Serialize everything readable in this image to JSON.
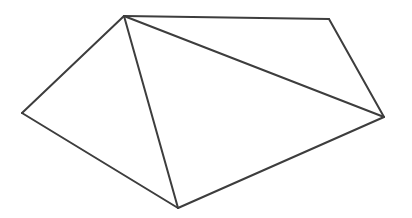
{
  "canvas": {
    "width": 412,
    "height": 218,
    "background_color": "#ffffff"
  },
  "figure": {
    "name": "pentagon-with-two-diagonals",
    "stroke_color": "#3d3d3d",
    "stroke_width": 2,
    "fill_color": "#ffffff",
    "vertices": [
      {
        "id": "apex",
        "label": "A",
        "x": 124,
        "y": 16
      },
      {
        "id": "top-right",
        "label": "B",
        "x": 329,
        "y": 19
      },
      {
        "id": "right",
        "label": "C",
        "x": 384,
        "y": 117
      },
      {
        "id": "bottom",
        "label": "D",
        "x": 178,
        "y": 208
      },
      {
        "id": "left",
        "label": "E",
        "x": 22,
        "y": 113
      }
    ],
    "outline_path": "M 124,16 L 329,19 L 384,117 L 178,208 L 22,113 Z",
    "edges": [
      {
        "id": "edge-top",
        "from": "apex",
        "to": "top-right",
        "kind": "outline",
        "path": "M 124,16 L 329,19"
      },
      {
        "id": "edge-upper-right",
        "from": "top-right",
        "to": "right",
        "kind": "outline",
        "path": "M 329,19 L 384,117"
      },
      {
        "id": "edge-lower-right",
        "from": "right",
        "to": "bottom",
        "kind": "outline",
        "path": "M 384,117 L 178,208"
      },
      {
        "id": "edge-lower-left",
        "from": "bottom",
        "to": "left",
        "kind": "outline",
        "path": "M 178,208 L 22,113"
      },
      {
        "id": "edge-upper-left",
        "from": "left",
        "to": "apex",
        "kind": "outline",
        "path": "M 22,113 L 124,16"
      },
      {
        "id": "diagonal-apex-bottom",
        "from": "apex",
        "to": "bottom",
        "kind": "diagonal",
        "path": "M 124,16 L 178,208"
      },
      {
        "id": "diagonal-apex-right",
        "from": "apex",
        "to": "right",
        "kind": "diagonal",
        "path": "M 124,16 L 384,117"
      }
    ],
    "faces": [
      {
        "id": "triangle-left",
        "vertices": [
          "apex",
          "left",
          "bottom"
        ],
        "path": "M 124,16 L 22,113 L 178,208 Z"
      },
      {
        "id": "triangle-middle",
        "vertices": [
          "apex",
          "bottom",
          "right"
        ],
        "path": "M 124,16 L 178,208 L 384,117 Z"
      },
      {
        "id": "triangle-right",
        "vertices": [
          "apex",
          "right",
          "top-right"
        ],
        "path": "M 124,16 L 384,117 L 329,19 Z"
      }
    ]
  }
}
